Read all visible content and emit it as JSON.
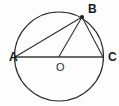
{
  "figure": {
    "kind": "circle-geometry-diagram",
    "background_color": "#fdfdfd",
    "stroke_color": "#2a2a2a",
    "label_color": "#1a1a1a",
    "width": 119,
    "height": 106
  },
  "circle": {
    "name": "circle-O",
    "center_x": 59,
    "center_y": 56.5,
    "radius": 44.5
  },
  "points": {
    "A": {
      "label": "A",
      "x": 15,
      "y": 57,
      "label_x": 9,
      "label_y": 61,
      "dot": false
    },
    "B": {
      "label": "B",
      "x": 82,
      "y": 17,
      "label_x": 88,
      "label_y": 13,
      "dot": true
    },
    "C": {
      "label": "C",
      "x": 103,
      "y": 57,
      "label_x": 108,
      "label_y": 61,
      "dot": false
    },
    "O": {
      "label": "O",
      "x": 59,
      "y": 56.5,
      "label_x": 56,
      "label_y": 71,
      "dot": false
    }
  },
  "segments": [
    {
      "name": "segment-AC-diameter",
      "from": "A",
      "to": "C",
      "style": "diameter"
    },
    {
      "name": "segment-AB-chord",
      "from": "A",
      "to": "B",
      "style": "chord"
    },
    {
      "name": "segment-BC-chord",
      "from": "B",
      "to": "C",
      "style": "chord"
    },
    {
      "name": "segment-OB-radius",
      "from": "O",
      "to": "B",
      "style": "radius"
    }
  ],
  "labels": {
    "a": "A",
    "b": "B",
    "c": "C",
    "o": "O"
  }
}
